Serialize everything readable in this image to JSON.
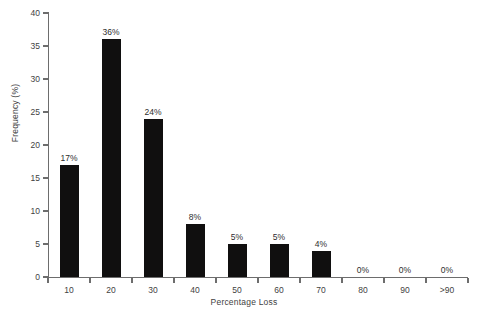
{
  "chart_data": {
    "type": "bar",
    "title": "",
    "subtitle": "",
    "xlabel": "Percentage Loss",
    "ylabel": "Frequency (%)",
    "categories": [
      "10",
      "20",
      "30",
      "40",
      "50",
      "60",
      "70",
      "80",
      "90",
      ">90"
    ],
    "values": [
      17,
      36,
      24,
      8,
      5,
      5,
      4,
      0,
      0,
      0
    ],
    "data_labels": [
      "17%",
      "36%",
      "24%",
      "8%",
      "5%",
      "5%",
      "4%",
      "0%",
      "0%",
      "0%"
    ],
    "ylim": [
      0,
      40
    ],
    "ytick_values": [
      0,
      5,
      10,
      15,
      20,
      25,
      30,
      35,
      40
    ],
    "ytick_labels": [
      "0",
      "5",
      "10",
      "15",
      "20",
      "25",
      "30",
      "35",
      "40"
    ],
    "grid": false,
    "legend": null,
    "legend_position": "none",
    "bar_color": "#100f0f",
    "axis_color": "#6d6d6d",
    "text_color": "#3f3f3f",
    "background_color": "#ffffff"
  }
}
